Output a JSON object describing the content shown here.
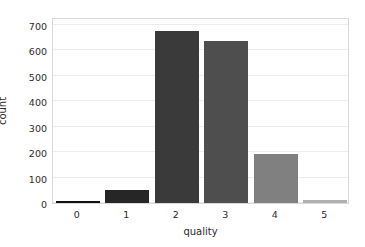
{
  "chart_data": {
    "type": "bar",
    "title": "",
    "subtitle": "",
    "xlabel": "quality",
    "ylabel": "count",
    "categories": [
      "0",
      "1",
      "2",
      "3",
      "4",
      "5"
    ],
    "values": [
      8,
      50,
      675,
      634,
      192,
      10
    ],
    "series": [
      {
        "name": "count",
        "values": [
          8,
          50,
          675,
          634,
          192,
          10
        ]
      }
    ],
    "bar_colors": [
      "#111111",
      "#262626",
      "#3a3a3a",
      "#4e4e4e",
      "#808080",
      "#b0b0b0"
    ],
    "ylim": [
      0,
      730
    ],
    "yticks": [
      0,
      100,
      200,
      300,
      400,
      500,
      600,
      700
    ],
    "ytick_labels": [
      "0",
      "100",
      "200",
      "300",
      "400",
      "500",
      "600",
      "700"
    ],
    "xtick_labels": [
      "0",
      "1",
      "2",
      "3",
      "4",
      "5"
    ],
    "grid": true,
    "grid_axis": "y",
    "grid_color": "#ececec",
    "legend": false,
    "legend_position": "none",
    "spine_color": "#d9d9d9",
    "background_color": "#ffffff",
    "text_color": "#2b2b2b",
    "annotations": []
  }
}
